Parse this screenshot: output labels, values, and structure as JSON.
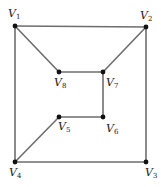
{
  "diagram": {
    "type": "undirected-graph",
    "vertices": [
      {
        "id": "V1",
        "letter": "V",
        "sub": "1",
        "x": 15,
        "y": 26,
        "lx": 8,
        "ly": 17
      },
      {
        "id": "V2",
        "letter": "V",
        "sub": "2",
        "x": 146,
        "y": 27,
        "lx": 140,
        "ly": 19
      },
      {
        "id": "V3",
        "letter": "V",
        "sub": "3",
        "x": 146,
        "y": 162,
        "lx": 145,
        "ly": 176
      },
      {
        "id": "V4",
        "letter": "V",
        "sub": "4",
        "x": 15,
        "y": 162,
        "lx": 9,
        "ly": 176
      },
      {
        "id": "V5",
        "letter": "V",
        "sub": "5",
        "x": 59,
        "y": 117,
        "lx": 58,
        "ly": 130
      },
      {
        "id": "V6",
        "letter": "V",
        "sub": "6",
        "x": 103,
        "y": 117,
        "lx": 106,
        "ly": 132
      },
      {
        "id": "V7",
        "letter": "V",
        "sub": "7",
        "x": 103,
        "y": 72,
        "lx": 106,
        "ly": 86
      },
      {
        "id": "V8",
        "letter": "V",
        "sub": "8",
        "x": 59,
        "y": 72,
        "lx": 54,
        "ly": 86
      }
    ],
    "edges": [
      [
        "V1",
        "V2"
      ],
      [
        "V1",
        "V4"
      ],
      [
        "V1",
        "V8"
      ],
      [
        "V2",
        "V3"
      ],
      [
        "V2",
        "V7"
      ],
      [
        "V8",
        "V7"
      ],
      [
        "V7",
        "V6"
      ],
      [
        "V6",
        "V5"
      ],
      [
        "V5",
        "V4"
      ],
      [
        "V4",
        "V3"
      ]
    ]
  }
}
